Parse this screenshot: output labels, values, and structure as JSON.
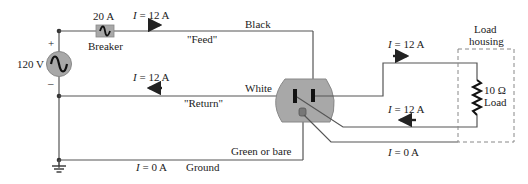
{
  "source": {
    "voltage_label": "120 V",
    "plus_label": "+",
    "minus_label": "–"
  },
  "breaker": {
    "rating_label": "20 A",
    "label": "Breaker"
  },
  "feed": {
    "current_symbol": "I",
    "current_value": " = 12 A",
    "wire_color_label": "Black",
    "name_label": "\"Feed\""
  },
  "return": {
    "current_symbol": "I",
    "current_value": " = 12 A",
    "wire_color_label": "White",
    "name_label": "\"Return\""
  },
  "ground": {
    "current_symbol": "I",
    "current_value": " = 0 A",
    "label": "Ground",
    "wire_color_label": "Green or bare"
  },
  "load_side": {
    "top_current_symbol": "I",
    "top_current_value": " = 12 A",
    "bottom_current_symbol": "I",
    "bottom_current_value": " = 12 A",
    "ground_current_symbol": "I",
    "ground_current_value": " = 0 A"
  },
  "load": {
    "housing_label_line1": "Load",
    "housing_label_line2": "housing",
    "resistance_label": "10 Ω",
    "name_label": "Load"
  },
  "colors": {
    "wire": "#555555",
    "outlet_fill": "#a8a8a8",
    "source_fill": "#a8a8a8",
    "breaker_fill": "#a8a8a8",
    "housing_dash": "#888888"
  }
}
